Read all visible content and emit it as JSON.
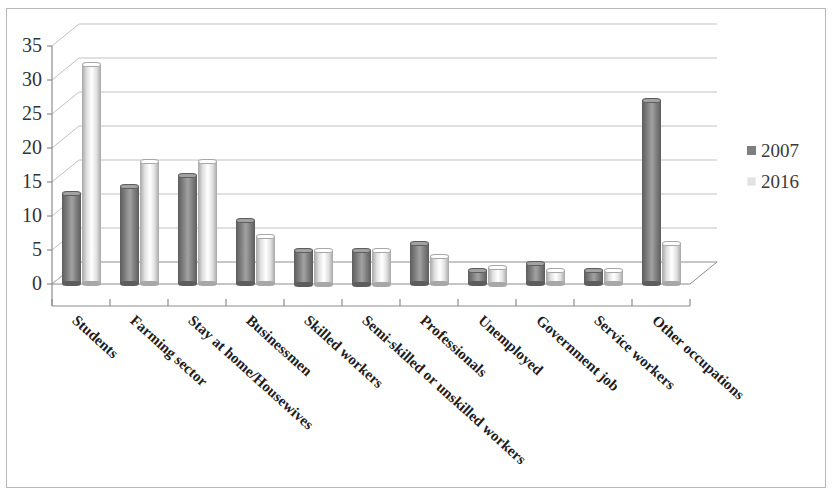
{
  "chart_data": {
    "type": "bar",
    "title": "",
    "subtitle": "",
    "xlabel": "",
    "ylabel": "",
    "ylim": [
      0,
      35
    ],
    "yticks": [
      0,
      5,
      10,
      15,
      20,
      25,
      30,
      35
    ],
    "grid": true,
    "legend_position": "right",
    "three_d": true,
    "bar_shape": "cylinder",
    "categories": [
      "Students",
      "Farming sector",
      "Stay at home/Housewives",
      "Businessmen",
      "Skilled workers",
      "Semi-skilled or unskilled workers",
      "Professionals",
      "Unemployed",
      "Government job",
      "Service workers",
      "Other occupations"
    ],
    "series": [
      {
        "name": "2007",
        "color": "#7e7e7e",
        "values": [
          13.3,
          14.3,
          16.0,
          9.3,
          5.0,
          5.0,
          6.0,
          2.0,
          3.0,
          2.0,
          27.0
        ]
      },
      {
        "name": "2016",
        "color": "#e2e2e2",
        "values": [
          32.3,
          18.0,
          18.0,
          7.0,
          5.0,
          5.0,
          4.0,
          2.5,
          2.0,
          2.0,
          6.0
        ]
      }
    ]
  },
  "legend": {
    "entries": [
      {
        "label": "2007",
        "color": "#7e7e7e"
      },
      {
        "label": "2016",
        "color": "#e2e2e2"
      }
    ]
  },
  "colors": {
    "series_2007": "#7e7e7e",
    "series_2016": "#e2e2e2",
    "gridline": "#c2c2c2",
    "axis": "#8d8d8d",
    "frame_border": "#b9b9b9",
    "text": "#2a2a2a",
    "background": "#ffffff"
  }
}
